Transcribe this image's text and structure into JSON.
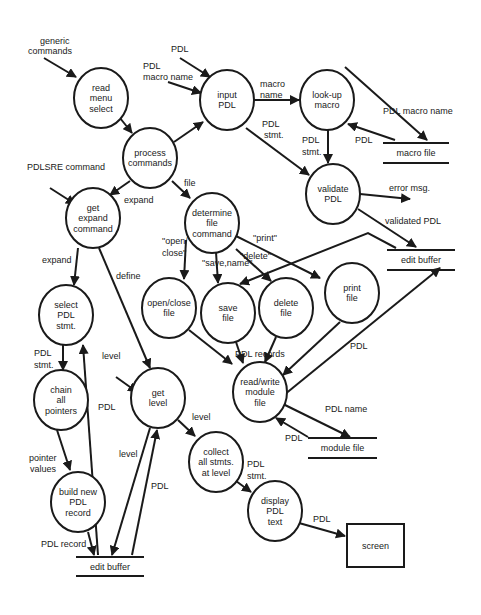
{
  "nodes": [
    {
      "id": "read_menu",
      "cx": 101,
      "cy": 98,
      "rx": 27,
      "ry": 30,
      "lines": [
        "read",
        "menu",
        "select"
      ]
    },
    {
      "id": "input_pdl",
      "cx": 227,
      "cy": 100,
      "rx": 27,
      "ry": 30,
      "lines": [
        "input",
        "PDL"
      ]
    },
    {
      "id": "lookup_macro",
      "cx": 327,
      "cy": 100,
      "rx": 27,
      "ry": 30,
      "lines": [
        "look-up",
        "macro"
      ]
    },
    {
      "id": "process_cmds",
      "cx": 150,
      "cy": 158,
      "rx": 27,
      "ry": 30,
      "lines": [
        "process",
        "commands"
      ]
    },
    {
      "id": "validate_pdl",
      "cx": 333,
      "cy": 194,
      "rx": 27,
      "ry": 30,
      "lines": [
        "validate",
        "PDL"
      ]
    },
    {
      "id": "get_expand",
      "cx": 93,
      "cy": 218,
      "rx": 27,
      "ry": 30,
      "lines": [
        "get",
        "expand",
        "command"
      ]
    },
    {
      "id": "determine_file",
      "cx": 212,
      "cy": 223,
      "rx": 27,
      "ry": 30,
      "lines": [
        "determine",
        "file",
        "command"
      ]
    },
    {
      "id": "select_pdl",
      "cx": 66,
      "cy": 315,
      "rx": 27,
      "ry": 30,
      "lines": [
        "select",
        "PDL",
        "stmt."
      ]
    },
    {
      "id": "open_close",
      "cx": 169,
      "cy": 308,
      "rx": 27,
      "ry": 30,
      "lines": [
        "open/close",
        "file"
      ]
    },
    {
      "id": "save_file",
      "cx": 228,
      "cy": 313,
      "rx": 27,
      "ry": 30,
      "lines": [
        "save",
        "file"
      ]
    },
    {
      "id": "delete_file",
      "cx": 286,
      "cy": 308,
      "rx": 27,
      "ry": 30,
      "lines": [
        "delete",
        "file"
      ]
    },
    {
      "id": "print_file",
      "cx": 352,
      "cy": 293,
      "rx": 27,
      "ry": 30,
      "lines": [
        "print",
        "file"
      ]
    },
    {
      "id": "read_write",
      "cx": 260,
      "cy": 392,
      "rx": 27,
      "ry": 30,
      "lines": [
        "read/write",
        "module",
        "file"
      ]
    },
    {
      "id": "get_level",
      "cx": 158,
      "cy": 398,
      "rx": 27,
      "ry": 30,
      "lines": [
        "get",
        "level"
      ]
    },
    {
      "id": "chain_pointers",
      "cx": 61,
      "cy": 400,
      "rx": 27,
      "ry": 30,
      "lines": [
        "chain",
        "all",
        "pointers"
      ]
    },
    {
      "id": "collect_stmts",
      "cx": 216,
      "cy": 462,
      "rx": 27,
      "ry": 30,
      "lines": [
        "collect",
        "all stmts.",
        "at level"
      ]
    },
    {
      "id": "build_record",
      "cx": 78,
      "cy": 502,
      "rx": 27,
      "ry": 30,
      "lines": [
        "build new",
        "PDL",
        "record"
      ]
    },
    {
      "id": "display_text",
      "cx": 275,
      "cy": 511,
      "rx": 27,
      "ry": 30,
      "lines": [
        "display",
        "PDL",
        "text"
      ]
    }
  ],
  "stores": [
    {
      "id": "macro_file",
      "x1": 383,
      "x2": 449,
      "y": 143,
      "gap": 20,
      "label": "macro file"
    },
    {
      "id": "edit_buffer_top",
      "x1": 387,
      "x2": 455,
      "y": 250,
      "gap": 20,
      "label": "edit buffer"
    },
    {
      "id": "module_file",
      "x1": 308,
      "x2": 377,
      "y": 438,
      "gap": 20,
      "label": "module file"
    },
    {
      "id": "edit_buffer_bottom",
      "x1": 76,
      "x2": 144,
      "y": 557,
      "gap": 19,
      "label": "edit buffer"
    }
  ],
  "terminators": [
    {
      "id": "screen",
      "x": 347,
      "y": 524,
      "w": 57,
      "h": 43,
      "label": "screen"
    }
  ],
  "edges": [
    {
      "from": [
        44,
        58
      ],
      "to": [
        76,
        77
      ]
    },
    {
      "from": [
        180,
        58
      ],
      "to": [
        210,
        77
      ]
    },
    {
      "from": [
        168,
        82
      ],
      "to": [
        201,
        93
      ]
    },
    {
      "from": [
        116,
        113
      ],
      "to": [
        132,
        133
      ]
    },
    {
      "from": [
        174,
        142
      ],
      "to": [
        203,
        122
      ]
    },
    {
      "from": [
        254,
        100
      ],
      "to": [
        299,
        100
      ]
    },
    {
      "from": [
        345,
        67
      ],
      "to": [
        427,
        140
      ]
    },
    {
      "from": [
        395,
        140
      ],
      "to": [
        348,
        124
      ]
    },
    {
      "from": [
        328,
        130
      ],
      "to": [
        328,
        163
      ]
    },
    {
      "from": [
        246,
        128
      ],
      "to": [
        309,
        175
      ]
    },
    {
      "from": [
        360,
        194
      ],
      "to": [
        410,
        199
      ]
    },
    {
      "from": [
        358,
        209
      ],
      "to": [
        416,
        247
      ]
    },
    {
      "from": [
        50,
        188
      ],
      "to": [
        75,
        204
      ]
    },
    {
      "from": [
        130,
        181
      ],
      "to": [
        110,
        195
      ]
    },
    {
      "from": [
        172,
        181
      ],
      "to": [
        190,
        198
      ]
    },
    {
      "from": [
        78,
        248
      ],
      "to": [
        74,
        285
      ]
    },
    {
      "from": [
        99,
        248
      ],
      "to": [
        150,
        368
      ]
    },
    {
      "from": [
        186,
        240
      ],
      "to": [
        184,
        279
      ]
    },
    {
      "from": [
        216,
        252
      ],
      "to": [
        218,
        283
      ]
    },
    {
      "from": [
        236,
        249
      ],
      "to": [
        271,
        281
      ]
    },
    {
      "from": [
        236,
        236
      ],
      "to": [
        320,
        278
      ]
    },
    {
      "from": [
        396,
        248
      ],
      "to": [
        368,
        233
      ],
      "mid": [
        368,
        233
      ],
      "to2": [
        240,
        284
      ]
    },
    {
      "from": [
        189,
        330
      ],
      "to": [
        232,
        364
      ]
    },
    {
      "from": [
        236,
        342
      ],
      "to": [
        243,
        363
      ]
    },
    {
      "from": [
        276,
        337
      ],
      "to": [
        265,
        362
      ]
    },
    {
      "from": [
        340,
        322
      ],
      "to": [
        283,
        375
      ]
    },
    {
      "from": [
        284,
        395
      ],
      "to": [
        440,
        268
      ]
    },
    {
      "from": [
        283,
        404
      ],
      "to": [
        350,
        437
      ]
    },
    {
      "from": [
        308,
        437
      ],
      "to": [
        276,
        418
      ]
    },
    {
      "from": [
        63,
        345
      ],
      "to": [
        63,
        370
      ]
    },
    {
      "from": [
        98,
        555
      ],
      "to": [
        83,
        345
      ]
    },
    {
      "from": [
        116,
        377
      ],
      "to": [
        137,
        392
      ]
    },
    {
      "from": [
        57,
        430
      ],
      "to": [
        70,
        470
      ]
    },
    {
      "from": [
        88,
        532
      ],
      "to": [
        94,
        555
      ]
    },
    {
      "from": [
        150,
        428
      ],
      "to": [
        112,
        555
      ]
    },
    {
      "from": [
        132,
        555
      ],
      "to": [
        157,
        430
      ]
    },
    {
      "from": [
        178,
        420
      ],
      "to": [
        195,
        436
      ]
    },
    {
      "from": [
        236,
        481
      ],
      "to": [
        251,
        492
      ]
    },
    {
      "from": [
        299,
        523
      ],
      "to": [
        345,
        536
      ]
    }
  ],
  "labels": [
    {
      "x": 40,
      "y": 44,
      "text": "generic"
    },
    {
      "x": 28,
      "y": 54,
      "text": "commands"
    },
    {
      "x": 171,
      "y": 52,
      "text": "PDL"
    },
    {
      "x": 143,
      "y": 69,
      "text": "PDL"
    },
    {
      "x": 143,
      "y": 80,
      "text": "macro name"
    },
    {
      "x": 260,
      "y": 87,
      "text": "macro"
    },
    {
      "x": 260,
      "y": 98,
      "text": "name"
    },
    {
      "x": 383,
      "y": 114,
      "text": "PDL macro name"
    },
    {
      "x": 262,
      "y": 127,
      "text": "PDL"
    },
    {
      "x": 264,
      "y": 138,
      "text": "stmt."
    },
    {
      "x": 302,
      "y": 143,
      "text": "PDL"
    },
    {
      "x": 302,
      "y": 155,
      "text": "stmt."
    },
    {
      "x": 355,
      "y": 143,
      "text": "PDL"
    },
    {
      "x": 389,
      "y": 191,
      "text": "error msg."
    },
    {
      "x": 385,
      "y": 224,
      "text": "validated PDL"
    },
    {
      "x": 27,
      "y": 170,
      "text": "PDLSRE command"
    },
    {
      "x": 124,
      "y": 203,
      "text": "expand"
    },
    {
      "x": 184,
      "y": 186,
      "text": "file"
    },
    {
      "x": 42,
      "y": 263,
      "text": "expand"
    },
    {
      "x": 116,
      "y": 279,
      "text": "define"
    },
    {
      "x": 162,
      "y": 244,
      "text": "\"open/"
    },
    {
      "x": 162,
      "y": 256,
      "text": "close\""
    },
    {
      "x": 253,
      "y": 241,
      "text": "\"print\""
    },
    {
      "x": 240,
      "y": 259,
      "text": "\"delete\""
    },
    {
      "x": 202,
      "y": 266,
      "text": "\"save,name\""
    },
    {
      "x": 34,
      "y": 356,
      "text": "PDL"
    },
    {
      "x": 34,
      "y": 368,
      "text": "stmt."
    },
    {
      "x": 102,
      "y": 359,
      "text": "level"
    },
    {
      "x": 98,
      "y": 410,
      "text": "PDL"
    },
    {
      "x": 235,
      "y": 357,
      "text": "PDL records"
    },
    {
      "x": 350,
      "y": 349,
      "text": "PDL"
    },
    {
      "x": 325,
      "y": 412,
      "text": "PDL name"
    },
    {
      "x": 285,
      "y": 441,
      "text": "PDL"
    },
    {
      "x": 192,
      "y": 420,
      "text": "level"
    },
    {
      "x": 29,
      "y": 461,
      "text": "pointer"
    },
    {
      "x": 30,
      "y": 472,
      "text": "values"
    },
    {
      "x": 119,
      "y": 457,
      "text": "level"
    },
    {
      "x": 151,
      "y": 489,
      "text": "PDL"
    },
    {
      "x": 247,
      "y": 467,
      "text": "PDL"
    },
    {
      "x": 247,
      "y": 479,
      "text": "stmt."
    },
    {
      "x": 313,
      "y": 522,
      "text": "PDL"
    },
    {
      "x": 41,
      "y": 547,
      "text": "PDL record"
    }
  ]
}
